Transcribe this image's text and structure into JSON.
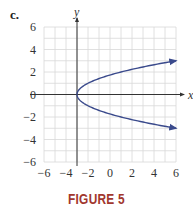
{
  "panel_label": "c.",
  "caption": "FIGURE 5",
  "colors": {
    "curve": "#3a4a8c",
    "grid": "#d8d8d8",
    "axis": "#333333",
    "caption": "#a1372e"
  },
  "chart_data": {
    "type": "line",
    "title": "",
    "xlabel": "x",
    "ylabel": "y",
    "xlim": [
      -6,
      6
    ],
    "ylim": [
      -6,
      6
    ],
    "xticks": [
      -6,
      -4,
      -2,
      0,
      2,
      4,
      6
    ],
    "yticks": [
      -6,
      -4,
      -2,
      0,
      2,
      4,
      6
    ],
    "grid": true,
    "vertical_axis_at_x": -3,
    "series": [
      {
        "name": "x = y^2 - 3",
        "equation": "x = y^2 - 3",
        "vertex": [
          -3,
          0
        ],
        "points": [
          [
            6,
            3
          ],
          [
            3.25,
            2.5
          ],
          [
            1,
            2
          ],
          [
            -0.75,
            1.5
          ],
          [
            -2,
            1
          ],
          [
            -2.75,
            0.5
          ],
          [
            -3,
            0
          ],
          [
            -2.75,
            -0.5
          ],
          [
            -2,
            -1
          ],
          [
            -0.75,
            -1.5
          ],
          [
            1,
            -2
          ],
          [
            3.25,
            -2.5
          ],
          [
            6,
            -3
          ]
        ],
        "arrows": "both ends"
      }
    ]
  }
}
